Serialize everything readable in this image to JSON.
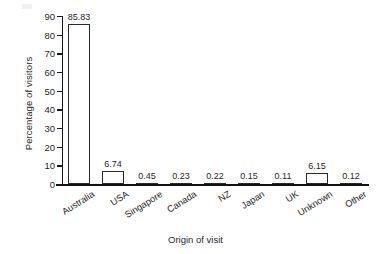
{
  "chart_data": {
    "type": "bar",
    "title": "",
    "xlabel": "Origin of visit",
    "ylabel": "Percentage of visitors",
    "categories": [
      "Australia",
      "USA",
      "Singapore",
      "Canada",
      "NZ",
      "Japan",
      "UK",
      "Unknown",
      "Other"
    ],
    "values": [
      85.83,
      6.74,
      0.45,
      0.23,
      0.22,
      0.15,
      0.11,
      6.15,
      0.12
    ],
    "value_labels": [
      "85.83",
      "6.74",
      "0.45",
      "0.23",
      "0.22",
      "0.15",
      "0.11",
      "6.15",
      "0.12"
    ],
    "ylim": [
      0,
      90
    ],
    "yticks": [
      0,
      10,
      20,
      30,
      40,
      50,
      60,
      70,
      80,
      90
    ],
    "ytick_labels": [
      "0",
      "10",
      "20",
      "30",
      "40",
      "50",
      "60",
      "70",
      "80",
      "90"
    ],
    "grid": false,
    "legend": false,
    "legend_position": "none",
    "bar_fill_color": "#ffffff",
    "bar_edge_color": "#2a2a2a",
    "axis_color": "#111111",
    "text_color": "#1f1f1f",
    "background_color": "#ffffff"
  }
}
